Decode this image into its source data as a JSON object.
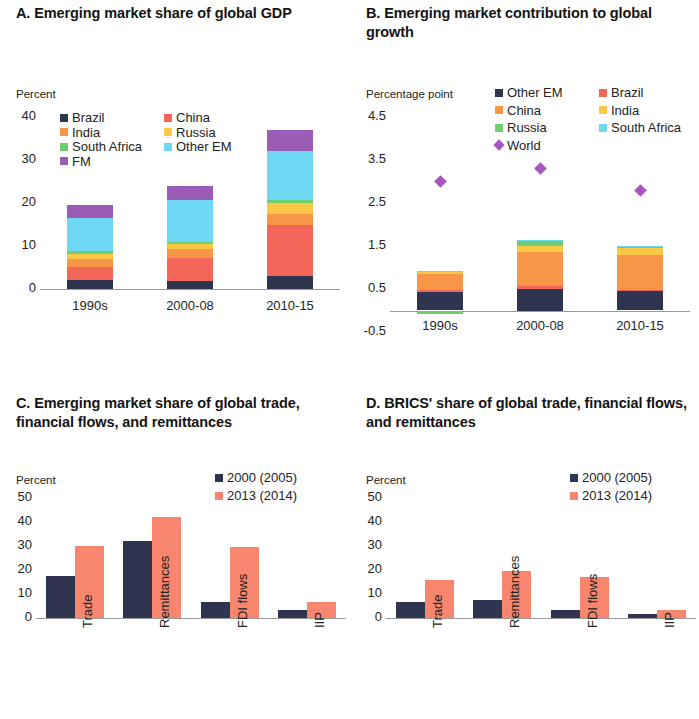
{
  "colors": {
    "brazil": "#f4655a",
    "china": "#f79646",
    "india": "#fbc846",
    "south_africa": "#6fce6f",
    "other_em": "#6ed7f2",
    "fm": "#9a5cb4",
    "navy": "#2f3450",
    "salmon": "#f8866e",
    "world": "#a857c0",
    "axis": "#9a9a9a",
    "text": "#232323"
  },
  "panels": {
    "a": {
      "title": "A. Emerging market share of global GDP",
      "axis_unit": "Percent",
      "legend": [
        {
          "label": "Brazil",
          "color": "#2f3450"
        },
        {
          "label": "China",
          "color": "#f4655a"
        },
        {
          "label": "India",
          "color": "#f79646"
        },
        {
          "label": "Russia",
          "color": "#fbc846"
        },
        {
          "label": "South Africa",
          "color": "#6fce6f"
        },
        {
          "label": "Other EM",
          "color": "#6ed7f2"
        },
        {
          "label": "FM",
          "color": "#9a5cb4"
        }
      ]
    },
    "b": {
      "title": "B. Emerging market contribution to global growth",
      "axis_unit": "Percentage point",
      "legend": [
        {
          "label": "Other EM",
          "color": "#2f3450"
        },
        {
          "label": "Brazil",
          "color": "#f4655a"
        },
        {
          "label": "China",
          "color": "#f79646"
        },
        {
          "label": "India",
          "color": "#fbc846"
        },
        {
          "label": "Russia",
          "color": "#6fce6f"
        },
        {
          "label": "South Africa",
          "color": "#6ed7f2"
        },
        {
          "label": "World",
          "color": "#a857c0",
          "marker": "diamond"
        }
      ]
    },
    "c": {
      "title": "C. Emerging market share of global trade, financial flows, and remittances",
      "axis_unit": "Percent",
      "legend": [
        {
          "label": "2000 (2005)",
          "color": "#2f3450"
        },
        {
          "label": "2013 (2014)",
          "color": "#f8866e"
        }
      ]
    },
    "d": {
      "title": "D. BRICS' share of global trade, financial flows, and remittances",
      "axis_unit": "Percent",
      "legend": [
        {
          "label": "2000 (2005)",
          "color": "#2f3450"
        },
        {
          "label": "2013 (2014)",
          "color": "#f8866e"
        }
      ]
    }
  },
  "chart_data": [
    {
      "panel": "A",
      "type": "bar",
      "stacked": true,
      "title": "A. Emerging market share of global GDP",
      "xlabel": "",
      "ylabel": "Percent",
      "ylim": [
        0,
        40
      ],
      "yticks": [
        0,
        10,
        20,
        30,
        40
      ],
      "grid": false,
      "legend_position": "upper-left",
      "categories": [
        "1990s",
        "2000-08",
        "2010-15"
      ],
      "series": [
        {
          "name": "Brazil",
          "color": "#2f3450",
          "values": [
            2.0,
            1.9,
            3.1
          ]
        },
        {
          "name": "China",
          "color": "#f4655a",
          "values": [
            3.1,
            5.2,
            11.9
          ]
        },
        {
          "name": "India",
          "color": "#f79646",
          "values": [
            1.9,
            2.1,
            2.5
          ]
        },
        {
          "name": "Russia",
          "color": "#fbc846",
          "values": [
            1.2,
            1.3,
            2.5
          ]
        },
        {
          "name": "South Africa",
          "color": "#6fce6f",
          "values": [
            0.6,
            0.5,
            0.8
          ]
        },
        {
          "name": "Other EM",
          "color": "#6ed7f2",
          "values": [
            7.7,
            9.8,
            11.2
          ]
        },
        {
          "name": "FM",
          "color": "#9a5cb4",
          "values": [
            3.0,
            3.2,
            5.0
          ]
        }
      ],
      "totals": [
        19.5,
        24.0,
        37.0
      ]
    },
    {
      "panel": "B",
      "type": "bar",
      "stacked": true,
      "title": "B. Emerging market contribution to global growth",
      "xlabel": "",
      "ylabel": "Percentage point",
      "ylim": [
        -0.5,
        4.5
      ],
      "yticks": [
        -0.5,
        0.5,
        1.5,
        2.5,
        3.5,
        4.5
      ],
      "grid": false,
      "legend_position": "upper-right",
      "categories": [
        "1990s",
        "2000-08",
        "2010-15"
      ],
      "series": [
        {
          "name": "Other EM",
          "color": "#2f3450",
          "values": [
            0.44,
            0.5,
            0.45
          ]
        },
        {
          "name": "Brazil",
          "color": "#f4655a",
          "values": [
            0.03,
            0.06,
            0.02
          ]
        },
        {
          "name": "China",
          "color": "#f79646",
          "values": [
            0.38,
            0.79,
            0.83
          ]
        },
        {
          "name": "India",
          "color": "#fbc846",
          "values": [
            0.07,
            0.15,
            0.17
          ]
        },
        {
          "name": "Russia",
          "color": "#6fce6f",
          "values": [
            -0.07,
            0.12,
            0.01
          ]
        },
        {
          "name": "South Africa",
          "color": "#6ed7f2",
          "values": [
            0.01,
            0.02,
            0.03
          ]
        }
      ],
      "overlay": {
        "name": "World",
        "type": "scatter",
        "marker": "diamond",
        "color": "#a857c0",
        "values": [
          3.0,
          3.3,
          2.8
        ]
      },
      "totals": [
        0.93,
        1.63,
        1.54
      ]
    },
    {
      "panel": "C",
      "type": "bar",
      "stacked": false,
      "title": "C. Emerging market share of global trade, financial flows, and remittances",
      "xlabel": "",
      "ylabel": "Percent",
      "ylim": [
        0,
        50
      ],
      "yticks": [
        0,
        10,
        20,
        30,
        40,
        50
      ],
      "grid": false,
      "legend_position": "upper-right",
      "categories": [
        "Trade",
        "Remittances",
        "FDI flows",
        "IIP"
      ],
      "series": [
        {
          "name": "2000 (2005)",
          "color": "#2f3450",
          "values": [
            17.5,
            32.0,
            6.5,
            3.5
          ]
        },
        {
          "name": "2013 (2014)",
          "color": "#f8866e",
          "values": [
            30.0,
            42.0,
            29.5,
            6.5
          ]
        }
      ]
    },
    {
      "panel": "D",
      "type": "bar",
      "stacked": false,
      "title": "D. BRICS' share of global trade, financial flows, and remittances",
      "xlabel": "",
      "ylabel": "Percent",
      "ylim": [
        0,
        50
      ],
      "yticks": [
        0,
        10,
        20,
        30,
        40,
        50
      ],
      "grid": false,
      "legend_position": "upper-right",
      "categories": [
        "Trade",
        "Remittances",
        "FDI flows",
        "IIP"
      ],
      "series": [
        {
          "name": "2000 (2005)",
          "color": "#2f3450",
          "values": [
            6.5,
            7.5,
            3.5,
            1.5
          ]
        },
        {
          "name": "2013 (2014)",
          "color": "#f8866e",
          "values": [
            16.0,
            19.5,
            17.0,
            3.5
          ]
        }
      ]
    }
  ]
}
